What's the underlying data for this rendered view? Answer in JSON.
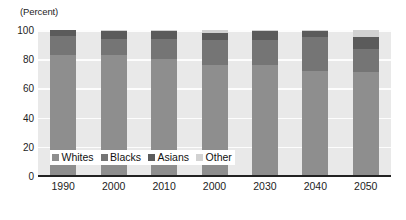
{
  "chart_data": {
    "type": "bar",
    "subtype": "stacked-100-percent",
    "title": "",
    "xlabel": "",
    "ylabel": "(Percent)",
    "ylim": [
      0,
      100
    ],
    "yticks": [
      0,
      20,
      40,
      60,
      80,
      100
    ],
    "grid": true,
    "legend_position": "inside-bottom-left",
    "categories": [
      "1990",
      "2000",
      "2010",
      "2000",
      "2030",
      "2040",
      "2050"
    ],
    "series": [
      {
        "name": "Whites",
        "color": "#8e8e8e",
        "values": [
          83,
          83,
          80,
          76,
          76,
          72,
          71
        ]
      },
      {
        "name": "Blacks",
        "color": "#757575",
        "values": [
          13,
          11,
          14,
          17,
          17,
          23,
          16
        ]
      },
      {
        "name": "Asians",
        "color": "#5b5b5b",
        "values": [
          4,
          5,
          5,
          5,
          6,
          4,
          8
        ]
      },
      {
        "name": "Other",
        "color": "#d2d2d2",
        "values": [
          0,
          1,
          1,
          2,
          1,
          1,
          5
        ]
      }
    ],
    "cumulative_tops": {
      "whites": [
        83,
        83,
        80,
        76,
        76,
        72,
        71
      ],
      "blacks": [
        96,
        94,
        94,
        93,
        93,
        95,
        87
      ],
      "asians": [
        100,
        99,
        99,
        98,
        99,
        99,
        95
      ],
      "other": [
        100,
        100,
        100,
        100,
        100,
        100,
        100
      ]
    }
  },
  "axes": {
    "unit_label": "(Percent)",
    "y_tick_labels": [
      "100",
      "80",
      "60",
      "40",
      "20",
      "0"
    ],
    "x_tick_labels": [
      "1990",
      "2000",
      "2010",
      "2000",
      "2030",
      "2040",
      "2050"
    ]
  },
  "legend": {
    "items": [
      {
        "label": "Whites",
        "color": "#8e8e8e"
      },
      {
        "label": "Blacks",
        "color": "#757575"
      },
      {
        "label": "Asians",
        "color": "#5b5b5b"
      },
      {
        "label": "Other",
        "color": "#d2d2d2"
      }
    ]
  },
  "style": {
    "plot_background": "#e9e9e9",
    "gridline_color": "#fdfdfd",
    "axis_color": "#222222",
    "text_color": "#1d1d1d"
  }
}
